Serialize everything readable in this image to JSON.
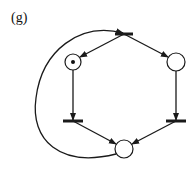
{
  "figure": {
    "label": "(g)",
    "type": "petri-net",
    "stroke_color": "#1a1a1a",
    "places": [
      {
        "id": "p-left",
        "cx": 73,
        "cy": 62,
        "r": 8,
        "tokens": 1
      },
      {
        "id": "p-right",
        "cx": 176,
        "cy": 62,
        "r": 9,
        "tokens": 0
      },
      {
        "id": "p-bottom",
        "cx": 124,
        "cy": 149,
        "r": 9,
        "tokens": 0
      }
    ],
    "transitions": [
      {
        "id": "t-top",
        "cx": 124,
        "cy": 34,
        "w": 18
      },
      {
        "id": "t-left",
        "cx": 73,
        "cy": 121,
        "w": 20
      },
      {
        "id": "t-right",
        "cx": 176,
        "cy": 121,
        "w": 20
      }
    ],
    "arcs": [
      {
        "from": "t-top",
        "to": "p-left"
      },
      {
        "from": "t-top",
        "to": "p-right"
      },
      {
        "from": "p-left",
        "to": "t-left"
      },
      {
        "from": "p-right",
        "to": "t-right"
      },
      {
        "from": "t-left",
        "to": "p-bottom"
      },
      {
        "from": "t-right",
        "to": "p-bottom"
      },
      {
        "from": "p-bottom",
        "to": "t-top",
        "curved": true
      }
    ]
  }
}
